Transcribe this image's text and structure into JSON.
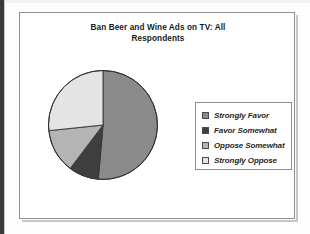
{
  "figure": {
    "title": "Ban Beer and Wine Ads on TV: All Respondents",
    "title_line_1": "Ban Beer and Wine Ads on TV: All",
    "title_line_2": "Respondents",
    "frame_border_color": "#8d8d8d",
    "background_color": "#ffffff"
  },
  "legend": {
    "position": "right",
    "border_color": "#8d8d8d",
    "items": [
      {
        "label": "Strongly Favor",
        "color": "#8a8a8a"
      },
      {
        "label": "Favor Somewhat",
        "color": "#3f3f3f"
      },
      {
        "label": "Oppose Somewhat",
        "color": "#b4b4b4"
      },
      {
        "label": "Strongly Oppose",
        "color": "#e4e4e4"
      }
    ]
  },
  "chart_data": {
    "type": "pie",
    "title": "Ban Beer and Wine Ads on TV: All Respondents",
    "xlabel": "",
    "ylabel": "",
    "grid": false,
    "legend_position": "right",
    "start_angle_deg": 0,
    "direction": "clockwise",
    "categories": [
      "Strongly Favor",
      "Favor Somewhat",
      "Oppose Somewhat",
      "Strongly Oppose"
    ],
    "values": [
      51,
      9,
      13,
      27
    ],
    "unit": "percent",
    "colors": [
      "#8a8a8a",
      "#3f3f3f",
      "#b4b4b4",
      "#e4e4e4"
    ],
    "slice_boundaries_deg": [
      0,
      185,
      217,
      264,
      360
    ],
    "slices": [
      {
        "label": "Strongly Favor",
        "value": 51,
        "color": "#8a8a8a",
        "start_deg": 0,
        "end_deg": 185
      },
      {
        "label": "Favor Somewhat",
        "value": 9,
        "color": "#3f3f3f",
        "start_deg": 185,
        "end_deg": 217
      },
      {
        "label": "Oppose Somewhat",
        "value": 13,
        "color": "#b4b4b4",
        "start_deg": 217,
        "end_deg": 264
      },
      {
        "label": "Strongly Oppose",
        "value": 27,
        "color": "#e4e4e4",
        "start_deg": 264,
        "end_deg": 360
      }
    ]
  }
}
